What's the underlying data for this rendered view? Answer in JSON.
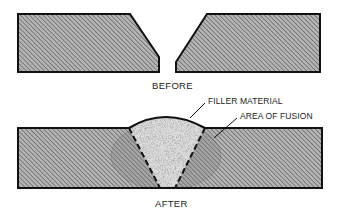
{
  "diagram": {
    "type": "welding-joint-cross-section",
    "before": {
      "caption": "BEFORE",
      "parts": [
        "left-beveled-plate",
        "right-beveled-plate"
      ]
    },
    "after": {
      "caption": "AFTER",
      "annotations": [
        {
          "id": "filler",
          "label": "FILLER MATERIAL"
        },
        {
          "id": "fusion",
          "label": "AREA OF FUSION"
        }
      ]
    },
    "colors": {
      "plate_fill": "#a8a8a8",
      "hatch": "#6e6e6e",
      "outline": "#111111",
      "filler": "#d8d8d8",
      "fusion": "#8a8a8a"
    }
  }
}
